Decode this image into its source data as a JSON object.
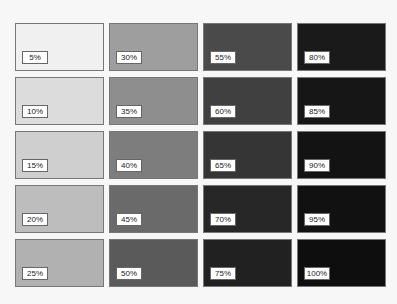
{
  "swatches": [
    {
      "label": "5%",
      "color": "#f0f0f0"
    },
    {
      "label": "10%",
      "color": "#dcdcdc"
    },
    {
      "label": "15%",
      "color": "#cfcfcf"
    },
    {
      "label": "20%",
      "color": "#bdbdbd"
    },
    {
      "label": "25%",
      "color": "#b1b1b1"
    },
    {
      "label": "30%",
      "color": "#9e9e9e"
    },
    {
      "label": "35%",
      "color": "#8e8e8e"
    },
    {
      "label": "40%",
      "color": "#7d7d7d"
    },
    {
      "label": "45%",
      "color": "#6a6a6a"
    },
    {
      "label": "50%",
      "color": "#5a5a5a"
    },
    {
      "label": "55%",
      "color": "#4a4a4a"
    },
    {
      "label": "60%",
      "color": "#404040"
    },
    {
      "label": "65%",
      "color": "#353535"
    },
    {
      "label": "70%",
      "color": "#272727"
    },
    {
      "label": "75%",
      "color": "#212121"
    },
    {
      "label": "80%",
      "color": "#1a1a1a"
    },
    {
      "label": "85%",
      "color": "#161616"
    },
    {
      "label": "90%",
      "color": "#131313"
    },
    {
      "label": "95%",
      "color": "#111111"
    },
    {
      "label": "100%",
      "color": "#0e0e0e"
    }
  ]
}
